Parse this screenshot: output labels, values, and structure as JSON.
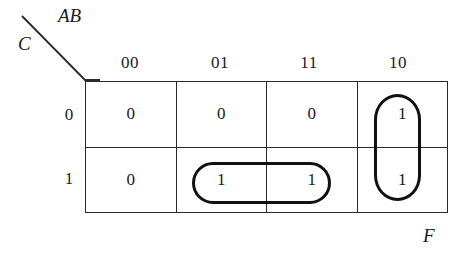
{
  "diagram": {
    "type": "karnaugh-map",
    "axis": {
      "columns_label": "AB",
      "rows_label": "C",
      "diagonal_icon": "diagonal-divider-icon"
    },
    "column_headers": [
      "00",
      "01",
      "11",
      "10"
    ],
    "row_headers": [
      "0",
      "1"
    ],
    "cells": [
      [
        "0",
        "0",
        "0",
        "1"
      ],
      [
        "0",
        "1",
        "1",
        "1"
      ]
    ],
    "groups": [
      {
        "name": "group-vertical-ab10",
        "shape": "rounded-rectangle",
        "orientation": "vertical",
        "covers": "AB=10, C=0 and C=1"
      },
      {
        "name": "group-horizontal-c1-ab01-11",
        "shape": "rounded-rectangle",
        "orientation": "horizontal",
        "covers": "C=1, AB=01 and AB=11"
      }
    ],
    "output_label": "F",
    "colors": {
      "background": "#ffffff",
      "grid_line": "#2a2a2a",
      "group_outline": "#111111",
      "text": "#1a1a1a"
    }
  }
}
